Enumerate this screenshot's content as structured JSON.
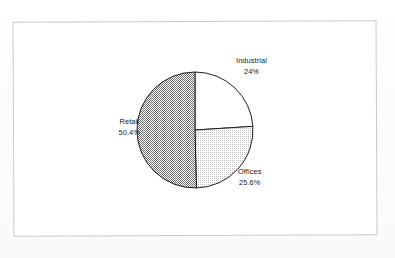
{
  "document": {
    "background_color": "#fdfdfd",
    "frame_color": "#c9c9c9"
  },
  "chart_data": {
    "type": "pie",
    "title": "",
    "subtitle": "",
    "xlabel": "",
    "ylabel": "",
    "legend_position": "none",
    "labels_position": "outside",
    "grid": false,
    "start_angle_deg": 0,
    "direction": "clockwise",
    "categories": [
      "Industrial",
      "Offices",
      "Retail"
    ],
    "values": [
      24,
      25.6,
      50.4
    ],
    "value_labels": [
      "24%",
      "25.6%",
      "50.4%"
    ],
    "unit": "%",
    "total": 100,
    "slices": [
      {
        "name": "Industrial",
        "value": 24,
        "value_label": "24%",
        "fill": "#ffffff",
        "fill_style": "solid",
        "stroke": "#1a1a1a",
        "start_angle_deg": 0,
        "end_angle_deg": 86.4
      },
      {
        "name": "Offices",
        "value": 25.6,
        "value_label": "25.6%",
        "fill": "#e2e2e2",
        "fill_style": "light-dither",
        "stroke": "#1a1a1a",
        "start_angle_deg": 86.4,
        "end_angle_deg": 178.6
      },
      {
        "name": "Retail",
        "value": 50.4,
        "value_label": "50.4%",
        "fill": "#a8a8a8",
        "fill_style": "medium-dither",
        "stroke": "#1a1a1a",
        "start_angle_deg": 178.6,
        "end_angle_deg": 360
      }
    ]
  },
  "labels": {
    "industrial": {
      "name": "Industrial",
      "value": "24%"
    },
    "offices": {
      "name": "Offices",
      "value": "25.6%"
    },
    "retail": {
      "name": "Retail",
      "value": "50.4%"
    }
  }
}
